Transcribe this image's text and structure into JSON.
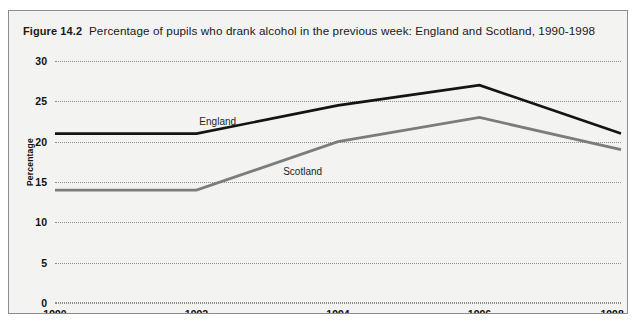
{
  "figure": {
    "number": "Figure 14.2",
    "caption": "Percentage of pupils who drank alcohol in the previous week: England and Scotland, 1990-1998"
  },
  "chart_data": {
    "type": "line",
    "title": "Percentage of pupils who drank alcohol in the previous week: England and Scotland, 1990-1998",
    "xlabel": "",
    "ylabel": "Percentage",
    "x": [
      1990,
      1992,
      1994,
      1996,
      1998
    ],
    "categories": [
      "1990",
      "1992",
      "1994",
      "1996",
      "1998"
    ],
    "xlim": [
      1990,
      1998
    ],
    "ylim": [
      0,
      30
    ],
    "yticks": [
      0,
      5,
      10,
      15,
      20,
      25,
      30
    ],
    "ytick_labels": [
      "0",
      "5",
      "10",
      "15",
      "20",
      "25",
      "30"
    ],
    "xtick_labels": [
      "1990",
      "1992",
      "1994",
      "1996",
      "1998"
    ],
    "grid": "horizontal-dotted",
    "legend": "inline-labels",
    "series": [
      {
        "name": "England",
        "color": "#141414",
        "values": [
          21,
          21,
          24.5,
          27,
          21
        ],
        "label_x": 1992.3,
        "label_y": 22.6
      },
      {
        "name": "Scotland",
        "color": "#7c7c7c",
        "values": [
          14,
          14,
          20,
          23,
          19
        ],
        "label_x": 1993.5,
        "label_y": 16.4
      }
    ]
  },
  "colors": {
    "panel_background": "#f3f3f1",
    "panel_border": "#8d8d8d",
    "gridline": "#8e8e8e",
    "text": "#111111",
    "england_line": "#141414",
    "scotland_line": "#7c7c7c"
  }
}
